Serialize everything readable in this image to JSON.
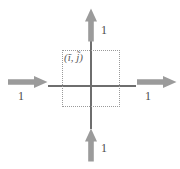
{
  "figure": {
    "title": "",
    "cell_label": "(ĩ, j̃)",
    "axis_color": "#6e6e6e",
    "arrow_color": "#9b9b9b",
    "box_color": "#9a9a9a",
    "label_color": "#4a4a4a"
  },
  "arrows": [
    {
      "id": "left",
      "label": "1",
      "direction": "right",
      "name": "arrow-left-pointing-right"
    },
    {
      "id": "right",
      "label": "1",
      "direction": "right",
      "name": "arrow-right-pointing-right"
    },
    {
      "id": "top",
      "label": "1",
      "direction": "up",
      "name": "arrow-top-pointing-up"
    },
    {
      "id": "bottom",
      "label": "1",
      "direction": "up",
      "name": "arrow-bottom-pointing-up"
    }
  ]
}
